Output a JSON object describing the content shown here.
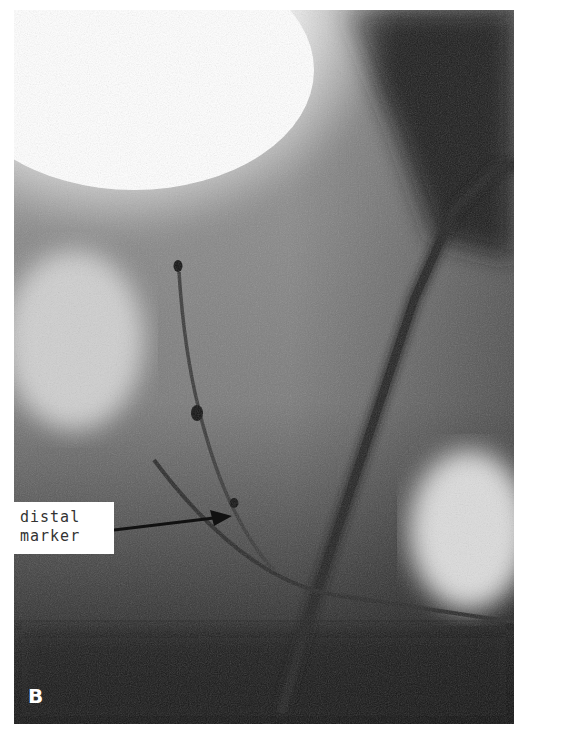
{
  "figure": {
    "panel_label": "B",
    "annotation": {
      "text": "distal\nmarker",
      "arrow": "right-pointing arrow toward catheter marker"
    },
    "colors": {
      "bright": "#ffffff",
      "mid": "#8a8a8a",
      "dark": "#141414",
      "catheter": "#1e1e1e"
    }
  }
}
